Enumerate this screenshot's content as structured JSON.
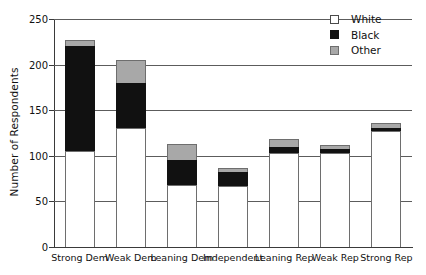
{
  "chart_data": {
    "type": "bar",
    "subtype": "stacked-bar",
    "title": "",
    "xlabel": "",
    "ylabel": "Number of Respondents",
    "ylim": [
      0,
      250
    ],
    "yticks": [
      0,
      50,
      100,
      150,
      200,
      250
    ],
    "grid": true,
    "grid_axis": "y",
    "legend_position": "top-right",
    "categories": [
      "Strong Dem",
      "Weak Dem",
      "Leaning Dem",
      "Independent",
      "Leaning Rep",
      "Weak Rep",
      "Strong Rep"
    ],
    "series": [
      {
        "name": "White",
        "color": "#ffffff",
        "values": [
          105,
          130,
          68,
          67,
          103,
          103,
          127
        ]
      },
      {
        "name": "Black",
        "color": "#111111",
        "values": [
          115,
          50,
          27,
          15,
          7,
          5,
          4
        ]
      },
      {
        "name": "Other",
        "color": "#a8a8a8",
        "values": [
          7,
          25,
          18,
          5,
          8,
          4,
          5
        ]
      }
    ],
    "totals": [
      227,
      205,
      113,
      87,
      118,
      112,
      136
    ]
  },
  "legend": {
    "items": [
      {
        "label": "White",
        "swatch": "white-swatch"
      },
      {
        "label": "Black",
        "swatch": "black-swatch"
      },
      {
        "label": "Other",
        "swatch": "other-swatch"
      }
    ]
  }
}
